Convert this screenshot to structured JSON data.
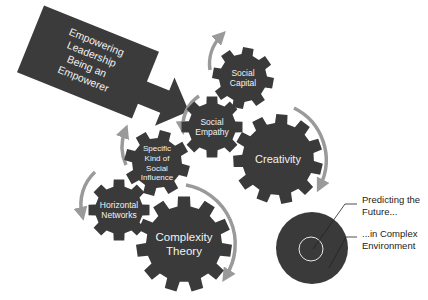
{
  "colors": {
    "gear": "#3a3a3a",
    "arrow_box": "#3b3b3b",
    "cycle_arrow": "#9a9a9a",
    "text_on_dark": "#f2f2f2",
    "label_text": "#222222",
    "background": "#ffffff"
  },
  "banner": {
    "lines": [
      "Empowering",
      "Leadership",
      "Being an",
      "Empowerer"
    ]
  },
  "gears": [
    {
      "id": "social-capital",
      "lines": [
        "Social",
        "Capital"
      ]
    },
    {
      "id": "social-empathy",
      "lines": [
        "Social",
        "Empathy"
      ]
    },
    {
      "id": "creativity",
      "lines": [
        "Creativity"
      ]
    },
    {
      "id": "specific-kind-of-social-influence",
      "lines": [
        "Specific",
        "Kind of",
        "Social",
        "Influence"
      ]
    },
    {
      "id": "horizontal-networks",
      "lines": [
        "Horizontal",
        "Networks"
      ]
    },
    {
      "id": "complexity-theory",
      "lines": [
        "Complexity",
        "Theory"
      ]
    }
  ],
  "target": {
    "label_inner": {
      "line1": "Predicting the",
      "line2": "Future..."
    },
    "label_outer": {
      "line1": "...in Complex",
      "line2": "Environment"
    }
  }
}
